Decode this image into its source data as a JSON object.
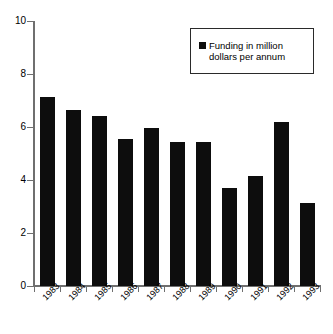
{
  "chart_data": {
    "type": "bar",
    "title": "",
    "xlabel": "",
    "ylabel": "",
    "categories": [
      "1983",
      "1984",
      "1985",
      "1986",
      "1987",
      "1988",
      "1989",
      "1990",
      "1991",
      "1992",
      "1993"
    ],
    "values": [
      7.15,
      6.65,
      6.4,
      5.55,
      5.95,
      5.45,
      5.45,
      3.7,
      4.15,
      6.2,
      3.15
    ],
    "series": [
      {
        "name": "Funding in million dollars per annum",
        "values": [
          7.15,
          6.65,
          6.4,
          5.55,
          5.95,
          5.45,
          5.45,
          3.7,
          4.15,
          6.2,
          3.15
        ]
      }
    ],
    "ylim": [
      0,
      10
    ],
    "y_ticks": [
      0,
      2,
      4,
      6,
      8,
      10
    ],
    "y_tick_labels": [
      "0",
      "2",
      "4",
      "6",
      "8",
      "10"
    ],
    "grid": false,
    "legend_position": "top-right",
    "bar_color": "#0d0d0d",
    "axis_color": "#6f6f6f"
  },
  "legend": {
    "label": "Funding in million dollars per annum",
    "swatch_color": "#0d0d0d"
  }
}
